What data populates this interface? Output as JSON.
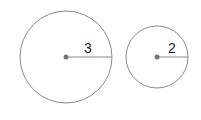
{
  "diagram": {
    "circles": [
      {
        "name": "large-circle",
        "cx": 66,
        "cy": 57,
        "r": 46,
        "radius_label": "3"
      },
      {
        "name": "small-circle",
        "cx": 157,
        "cy": 57,
        "r": 31,
        "radius_label": "2"
      }
    ],
    "colors": {
      "stroke": "#888888",
      "center_dot": "#777777",
      "text": "#222222",
      "background": "#ffffff"
    }
  }
}
